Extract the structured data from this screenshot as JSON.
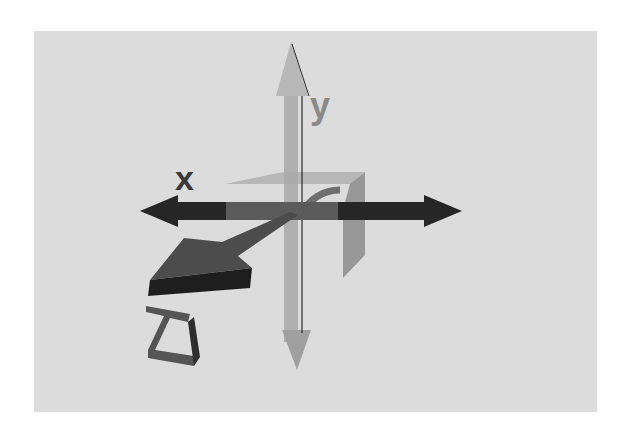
{
  "diagram": {
    "background_color": "#dcdcdc",
    "axes": [
      {
        "name": "x",
        "label": "x",
        "color": "#262626",
        "direction": "horizontal, double-headed"
      },
      {
        "name": "y",
        "label": "y",
        "color": "#a0a0a0",
        "direction": "vertical, double-headed"
      },
      {
        "name": "z",
        "label": "z",
        "color": "#3a3a3a",
        "direction": "diagonal toward viewer, lower-left"
      }
    ],
    "planes": [
      {
        "name": "xz-plane-fragment",
        "color": "#b4b4b4"
      },
      {
        "name": "yz-plane-fragment",
        "color": "#8a8a8a"
      }
    ]
  }
}
